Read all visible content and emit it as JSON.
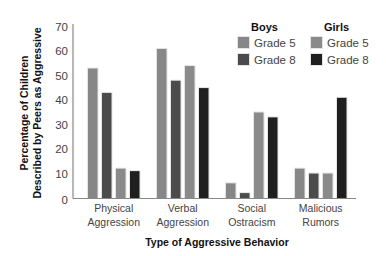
{
  "chart_data": {
    "type": "bar",
    "title": "",
    "xlabel": "Type of Aggressive Behavior",
    "ylabel": [
      "Percentage of Children",
      "Described by Peers as Aggressive"
    ],
    "ylim": [
      0,
      70
    ],
    "yticks": [
      0,
      10,
      20,
      30,
      40,
      50,
      60,
      70
    ],
    "grid": false,
    "legend_position": "top-right",
    "categories": [
      [
        "Physical",
        "Aggression"
      ],
      [
        "Verbal",
        "Aggression"
      ],
      [
        "Social",
        "Ostracism"
      ],
      [
        "Malicious",
        "Rumors"
      ]
    ],
    "series": [
      {
        "name": "Boys Grade 5",
        "group": "Boys",
        "label": "Grade 5",
        "color": "#878787",
        "values": [
          53,
          61,
          6,
          12
        ]
      },
      {
        "name": "Boys Grade 8",
        "group": "Boys",
        "label": "Grade 8",
        "color": "#4b4b4b",
        "values": [
          43,
          48,
          2,
          10
        ]
      },
      {
        "name": "Girls Grade 5",
        "group": "Girls",
        "label": "Grade 5",
        "color": "#8a8a8a",
        "values": [
          12,
          54,
          35,
          10
        ]
      },
      {
        "name": "Girls Grade 8",
        "group": "Girls",
        "label": "Grade 8",
        "color": "#1f1f1f",
        "values": [
          11,
          45,
          33,
          41
        ]
      }
    ],
    "legend": {
      "groups": [
        {
          "heading": "Boys",
          "items": [
            {
              "label": "Grade 5",
              "color": "#878787"
            },
            {
              "label": "Grade 8",
              "color": "#4b4b4b"
            }
          ]
        },
        {
          "heading": "Girls",
          "items": [
            {
              "label": "Grade 5",
              "color": "#8a8a8a"
            },
            {
              "label": "Grade 8",
              "color": "#1f1f1f"
            }
          ]
        }
      ]
    }
  }
}
